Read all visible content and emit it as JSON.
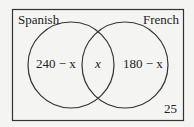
{
  "diagram": {
    "type": "venn",
    "sets": [
      {
        "label": "Spanish",
        "only_region": "240 − x"
      },
      {
        "label": "French",
        "only_region": "180 − x"
      }
    ],
    "intersection": "x",
    "outside": "25",
    "colors": {
      "stroke": "#333333",
      "background": "#f4f4f2"
    }
  }
}
